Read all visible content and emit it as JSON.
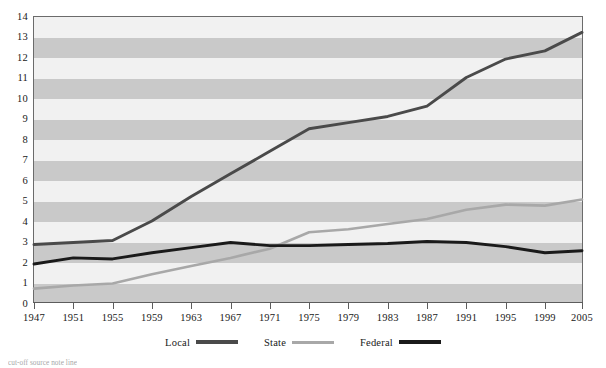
{
  "chart_data": {
    "type": "line",
    "title": "",
    "xlabel": "",
    "ylabel": "",
    "xlim": [
      1947,
      2005
    ],
    "ylim": [
      0,
      14
    ],
    "grid": "horizontal-alternating-bands",
    "legend_position": "bottom-center",
    "x_tick_labels": [
      "1947",
      "1951",
      "1955",
      "1959",
      "1963",
      "1967",
      "1971",
      "1975",
      "1979",
      "1983",
      "1987",
      "1991",
      "1995",
      "1999",
      "2005"
    ],
    "y_tick_labels": [
      "0",
      "1",
      "2",
      "3",
      "4",
      "5",
      "6",
      "7",
      "8",
      "9",
      "10",
      "11",
      "12",
      "13",
      "14"
    ],
    "x": [
      1947,
      1951,
      1955,
      1959,
      1963,
      1967,
      1971,
      1975,
      1979,
      1983,
      1987,
      1991,
      1995,
      1999,
      2005
    ],
    "series": [
      {
        "name": "Local",
        "color": "#4a4a4a",
        "values": [
          2.85,
          2.95,
          3.05,
          4.0,
          5.2,
          6.3,
          7.4,
          8.5,
          8.8,
          9.1,
          9.6,
          11.0,
          11.9,
          12.3,
          13.2
        ]
      },
      {
        "name": "State",
        "color": "#a8a8a8",
        "values": [
          0.7,
          0.85,
          0.95,
          1.4,
          1.8,
          2.2,
          2.65,
          3.45,
          3.6,
          3.85,
          4.1,
          4.55,
          4.8,
          4.75,
          5.05
        ]
      },
      {
        "name": "Federal",
        "color": "#1a1a1a",
        "values": [
          1.9,
          2.2,
          2.15,
          2.45,
          2.7,
          2.95,
          2.8,
          2.8,
          2.85,
          2.9,
          3.0,
          2.95,
          2.75,
          2.45,
          2.55
        ]
      }
    ]
  },
  "legend": {
    "items": [
      {
        "label": "Local",
        "color": "#4a4a4a"
      },
      {
        "label": "State",
        "color": "#a8a8a8"
      },
      {
        "label": "Federal",
        "color": "#1a1a1a"
      }
    ]
  },
  "axes": {
    "y_ticks": [
      "14",
      "13",
      "12",
      "11",
      "10",
      "9",
      "8",
      "7",
      "6",
      "5",
      "4",
      "3",
      "2",
      "1",
      "0"
    ],
    "x_ticks": [
      "1947",
      "1951",
      "1955",
      "1959",
      "1963",
      "1967",
      "1971",
      "1975",
      "1979",
      "1983",
      "1987",
      "1991",
      "1995",
      "1999",
      "2005"
    ]
  },
  "caption": {
    "text": "cut-off source note line"
  },
  "colors": {
    "band_light": "#f1f1f1",
    "band_dark": "#c9c9c9",
    "frame": "#6b6b6b",
    "local": "#4a4a4a",
    "state": "#a8a8a8",
    "federal": "#1a1a1a"
  }
}
